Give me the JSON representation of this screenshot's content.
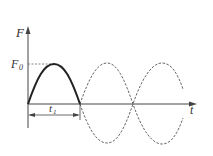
{
  "diagram": {
    "axes": {
      "y_label": "F",
      "x_label": "t",
      "amplitude_label_main": "F",
      "amplitude_label_sub": "0",
      "interval_label_main": "t",
      "interval_label_sub": "1"
    },
    "curves": [
      {
        "name": "solid-half-sine",
        "style": "solid",
        "description": "first half period from 0 to t1, peak F0"
      },
      {
        "name": "dashed-sine-positive",
        "style": "dashed",
        "description": "continuation sine after t1"
      },
      {
        "name": "dashed-sine-negative",
        "style": "dashed",
        "description": "mirrored sine after t1"
      }
    ],
    "colors": {
      "solid": "#222222",
      "dashed": "#555555",
      "axis": "#444444"
    }
  }
}
